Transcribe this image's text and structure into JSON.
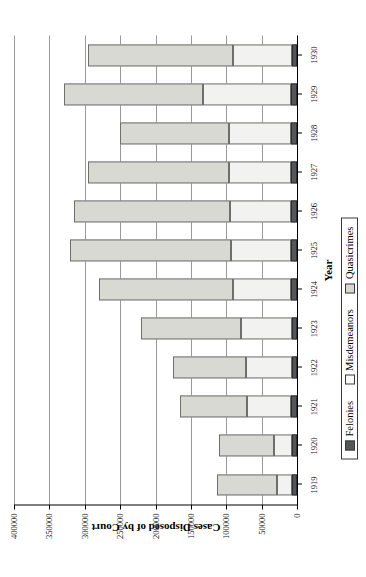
{
  "chart_data": {
    "type": "bar",
    "subtype": "stacked-horizontal-rotated",
    "title": "",
    "xlabel": "Year",
    "ylabel": "Cases Disposed of by Court",
    "categories": [
      "1919",
      "1920",
      "1921",
      "1922",
      "1923",
      "1924",
      "1925",
      "1926",
      "1927",
      "1928",
      "1929",
      "1930"
    ],
    "series": [
      {
        "name": "Felonies",
        "color": "#55565a",
        "values": [
          7000,
          7000,
          8000,
          7500,
          7500,
          8000,
          9000,
          8500,
          8000,
          8500,
          8000,
          7500
        ]
      },
      {
        "name": "Misdemeanors",
        "color": "#f2f2f0",
        "values": [
          22000,
          25000,
          62000,
          65000,
          72000,
          82000,
          84000,
          86000,
          88000,
          87000,
          125000,
          83000
        ]
      },
      {
        "name": "Quasicrimes",
        "color": "#d9d9d4",
        "values": [
          84000,
          78000,
          95000,
          103000,
          141000,
          190000,
          228000,
          221000,
          200000,
          155000,
          197000,
          205000
        ]
      }
    ],
    "totals": [
      113000,
      110000,
      165000,
      175500,
      220500,
      280000,
      321000,
      315500,
      296000,
      250500,
      330000,
      295500
    ],
    "ylim": [
      0,
      400000
    ],
    "yticks": [
      0,
      50000,
      100000,
      150000,
      200000,
      250000,
      300000,
      350000,
      400000
    ],
    "ytick_labels": [
      "0",
      "50000",
      "100000",
      "150000",
      "200000",
      "250000",
      "300000",
      "350000",
      "400000"
    ],
    "grid": "y-gridlines-only",
    "legend_position": "bottom",
    "legend_entries": [
      "Felonies",
      "Misdemeanors",
      "Quasicrimes"
    ]
  },
  "legend": {
    "items": [
      {
        "label": "Felonies",
        "swatch": "felonies"
      },
      {
        "label": "Misdemeanors",
        "swatch": "misdemeanors"
      },
      {
        "label": "Quasicrimes",
        "swatch": "quasicrimes"
      }
    ]
  },
  "axes": {
    "x_title": "Year",
    "y_title": "Cases Disposed of by Court"
  }
}
